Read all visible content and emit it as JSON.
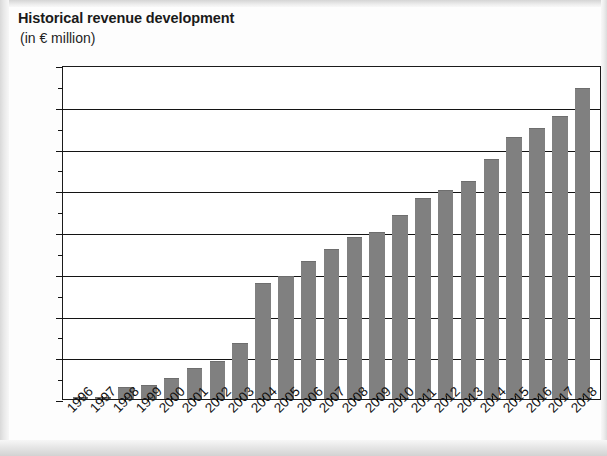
{
  "chart_data": {
    "type": "bar",
    "title": "Historical revenue development",
    "subtitle": "(in € million)",
    "xlabel": "",
    "ylabel": "",
    "unit": "€ million",
    "ylim": [
      0,
      4000
    ],
    "ytick_step": 500,
    "ytick_labels": [
      "4,000",
      "3,500",
      "3,000",
      "2,500",
      "2,000",
      "1,500",
      "1,000",
      "500",
      "0"
    ],
    "ytick_values": [
      4000,
      3500,
      3000,
      2500,
      2000,
      1500,
      1000,
      500,
      0
    ],
    "grid": true,
    "legend": false,
    "bar_color": "#808080",
    "axis_color": "#141414",
    "categories": [
      "1996",
      "1997",
      "1998",
      "1999",
      "2000",
      "2001",
      "2002",
      "2003",
      "2004",
      "2005",
      "2006",
      "2007",
      "2008",
      "2009",
      "2010",
      "2011",
      "2012",
      "2013",
      "2014",
      "2015",
      "2016",
      "2017",
      "2018"
    ],
    "values": [
      25,
      25,
      140,
      170,
      255,
      375,
      455,
      665,
      1390,
      1470,
      1655,
      1795,
      1945,
      1995,
      2200,
      2410,
      2500,
      2615,
      2875,
      3135,
      3245,
      3385,
      3720
    ]
  }
}
